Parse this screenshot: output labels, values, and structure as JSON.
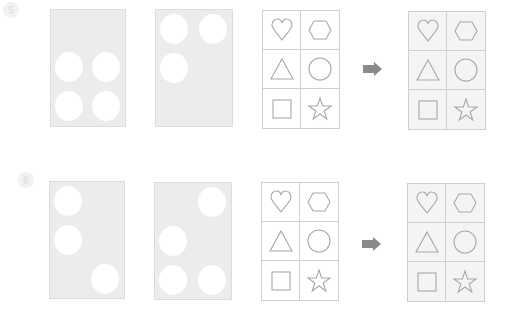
{
  "colors": {
    "card": "#ececec",
    "stroke": "#a8a8a8",
    "arrow": "#8a8a8a"
  },
  "puzzles": [
    {
      "marker": "5",
      "card_a_holes": [
        [
          0,
          1
        ],
        [
          1,
          1
        ],
        [
          0,
          2
        ],
        [
          1,
          2
        ]
      ],
      "card_b_holes": [
        [
          0,
          0
        ],
        [
          1,
          0
        ],
        [
          0,
          1
        ]
      ],
      "grid_shapes": [
        "heart-icon",
        "hexagon-icon",
        "triangle-icon",
        "circle-icon",
        "square-icon",
        "star-icon"
      ],
      "arrow": "right-arrow-icon"
    },
    {
      "marker": "6",
      "card_a_holes": [
        [
          0,
          0
        ],
        [
          0,
          1
        ],
        [
          1,
          2
        ]
      ],
      "card_b_holes": [
        [
          1,
          0
        ],
        [
          0,
          1
        ],
        [
          0,
          2
        ],
        [
          1,
          2
        ]
      ],
      "grid_shapes": [
        "heart-icon",
        "hexagon-icon",
        "triangle-icon",
        "circle-icon",
        "square-icon",
        "star-icon"
      ],
      "arrow": "right-arrow-icon"
    }
  ]
}
